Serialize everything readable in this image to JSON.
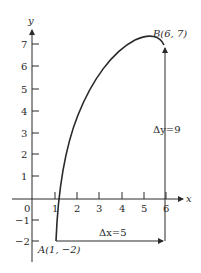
{
  "diagram": {
    "type": "coordinate-plot",
    "axes": {
      "x_label": "x",
      "y_label": "y",
      "x_ticks": [
        "0",
        "1",
        "2",
        "3",
        "4",
        "5",
        "6"
      ],
      "y_ticks": [
        "7",
        "6",
        "5",
        "4",
        "3",
        "2",
        "1",
        "−1",
        "−2"
      ]
    },
    "points": {
      "A": {
        "label": "A(1, −2)",
        "x": 1,
        "y": -2
      },
      "B": {
        "label": "B(6, 7)",
        "x": 6,
        "y": 7
      }
    },
    "annotations": {
      "delta_x": "Δx=5",
      "delta_y": "Δy=9"
    },
    "colors": {
      "stroke": "#2a2a2a",
      "background": "#ffffff"
    }
  }
}
